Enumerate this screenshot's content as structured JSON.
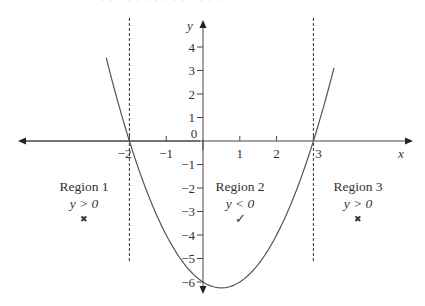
{
  "top_cut_text": "· · · · · · · · · · · · · ·",
  "axes": {
    "x_label": "x",
    "y_label": "y",
    "x_ticks": [
      {
        "value": -2,
        "label": "−2"
      },
      {
        "value": -1,
        "label": "−1"
      },
      {
        "value": 0,
        "label": "0"
      },
      {
        "value": 1,
        "label": "1"
      },
      {
        "value": 2,
        "label": "2"
      },
      {
        "value": 3,
        "label": "3"
      }
    ],
    "y_ticks": [
      {
        "value": 4,
        "label": "4"
      },
      {
        "value": 3,
        "label": "3"
      },
      {
        "value": 2,
        "label": "2"
      },
      {
        "value": 1,
        "label": "1"
      },
      {
        "value": -1,
        "label": "−1"
      },
      {
        "value": -2,
        "label": "−2"
      },
      {
        "value": -3,
        "label": "−3"
      },
      {
        "value": -4,
        "label": "−4"
      },
      {
        "value": -5,
        "label": "−5"
      },
      {
        "value": -6,
        "label": "−6"
      }
    ]
  },
  "curve": {
    "equation": "y = x² − x − 6",
    "roots": [
      -2,
      3
    ],
    "vertex": [
      0.5,
      -6.25
    ]
  },
  "boundaries": [
    {
      "x": -2,
      "style": "dashed"
    },
    {
      "x": 3,
      "style": "dashed"
    }
  ],
  "regions": [
    {
      "name": "Region 1",
      "condition": "y > 0",
      "mark": "✖",
      "mark_meaning": "cross"
    },
    {
      "name": "Region 2",
      "condition": "y < 0",
      "mark": "✓",
      "mark_meaning": "tick"
    },
    {
      "name": "Region 3",
      "condition": "y > 0",
      "mark": "✖",
      "mark_meaning": "cross"
    }
  ],
  "colors": {
    "line": "#333333",
    "curve": "#555555",
    "background": "#ffffff"
  }
}
